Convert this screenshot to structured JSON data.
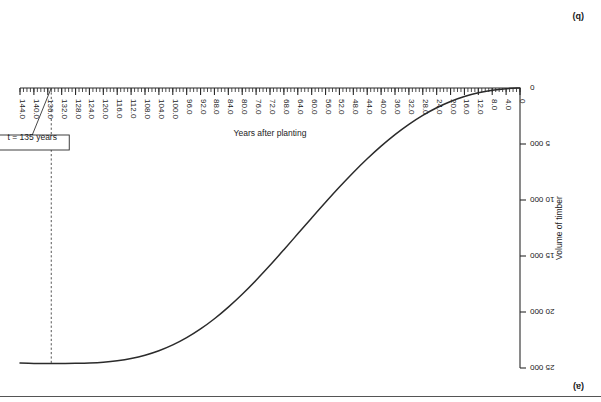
{
  "page": {
    "panel_label_bottom_right": "(a)",
    "panel_label_top_right": "(b)"
  },
  "chart_data": {
    "type": "line",
    "title": "",
    "xlabel": "Years after planting",
    "ylabel": "Volume of timber",
    "xlim": [
      0,
      144
    ],
    "ylim": [
      0,
      25000
    ],
    "grid": false,
    "legend": "none",
    "orientation_note": "figure rendered rotated 180 degrees",
    "x_tick_labels": [
      "0",
      "4.0",
      "8.0",
      "12.0",
      "16.0",
      "20.0",
      "24.0",
      "28.0",
      "32.0",
      "36.0",
      "40.0",
      "44.0",
      "48.0",
      "52.0",
      "56.0",
      "60.0",
      "64.0",
      "68.0",
      "72.0",
      "76.0",
      "80.0",
      "84.0",
      "88.0",
      "92.0",
      "96.0",
      "100.0",
      "104.0",
      "108.0",
      "112.0",
      "116.0",
      "120.0",
      "124.0",
      "128.0",
      "132.0",
      "136.0",
      "140.0",
      "144.0"
    ],
    "x_tick_values": [
      0,
      4,
      8,
      12,
      16,
      20,
      24,
      28,
      32,
      36,
      40,
      44,
      48,
      52,
      56,
      60,
      64,
      68,
      72,
      76,
      80,
      84,
      88,
      92,
      96,
      100,
      104,
      108,
      112,
      116,
      120,
      124,
      128,
      132,
      136,
      140,
      144
    ],
    "x_minor_tick_step": 1,
    "y_tick_labels": [
      "0",
      "5 000",
      "10 000",
      "15 000",
      "20 000",
      "25 000"
    ],
    "y_tick_values": [
      0,
      5000,
      10000,
      15000,
      20000,
      25000
    ],
    "series": [
      {
        "name": "Volume of timber",
        "x": [
          0,
          4,
          8,
          12,
          16,
          20,
          24,
          28,
          32,
          36,
          40,
          44,
          48,
          52,
          56,
          60,
          64,
          68,
          72,
          76,
          80,
          84,
          88,
          92,
          96,
          100,
          104,
          108,
          112,
          116,
          120,
          124,
          128,
          132,
          136,
          140,
          144
        ],
        "y": [
          0,
          60,
          200,
          430,
          760,
          1200,
          1760,
          2440,
          3240,
          4160,
          5190,
          6320,
          7540,
          8840,
          10200,
          11600,
          13020,
          14440,
          15830,
          17160,
          18410,
          19560,
          20600,
          21510,
          22290,
          22940,
          23460,
          23860,
          24150,
          24350,
          24480,
          24550,
          24580,
          24590,
          24595,
          24590,
          24560
        ]
      }
    ],
    "annotations": [
      {
        "name": "maximum-marker",
        "label": "t = 135 years",
        "x": 135,
        "y": 24595,
        "style": "boxed callout with leader line and vertical dashed line to axis"
      }
    ]
  },
  "colors": {
    "curve": "#2b2b2b",
    "axis": "#2a2a2a",
    "marker": "#555555",
    "text": "#232323",
    "background": "#ffffff"
  }
}
